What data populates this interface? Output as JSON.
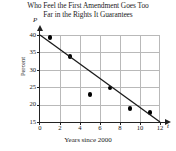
{
  "chart_data": {
    "type": "scatter",
    "title": "Who Feel the First Amendment Goes Too Far in the Rights It Guarantees",
    "title_line1": "Who Feel the First Amendment Goes Too",
    "title_line2": "Far in the Rights It Guarantees",
    "xlabel": "Years since 2000",
    "ylabel": "Percent",
    "x_axis_variable": "t",
    "y_axis_variable": "P",
    "xlim": [
      0,
      12
    ],
    "ylim": [
      15,
      40
    ],
    "xticks": [
      0,
      2,
      4,
      6,
      8,
      10,
      12
    ],
    "yticks": [
      15,
      20,
      25,
      30,
      35,
      40
    ],
    "xtick_labels": [
      "0",
      "2",
      "4",
      "6",
      "8",
      "10",
      "12"
    ],
    "ytick_labels": [
      "15",
      "20",
      "25",
      "30",
      "35",
      "40"
    ],
    "grid": true,
    "legend": "none",
    "x": [
      1,
      3,
      5,
      7,
      9,
      11
    ],
    "values": [
      39.3,
      33.9,
      22.9,
      24.8,
      18.8,
      17.7
    ],
    "series": [
      {
        "name": "Percent",
        "marker": "filled-circle",
        "color": "#000000",
        "points": [
          {
            "x": 1,
            "y": 39.3
          },
          {
            "x": 3,
            "y": 33.9
          },
          {
            "x": 5,
            "y": 22.9
          },
          {
            "x": 7,
            "y": 24.8
          },
          {
            "x": 9,
            "y": 18.8
          },
          {
            "x": 11,
            "y": 17.7
          }
        ]
      },
      {
        "name": "trend line",
        "type": "line",
        "color": "#1a1a1a",
        "endpoints": [
          {
            "x": 0,
            "y": 40.0
          },
          {
            "x": 12,
            "y": 15.0
          }
        ]
      }
    ]
  }
}
